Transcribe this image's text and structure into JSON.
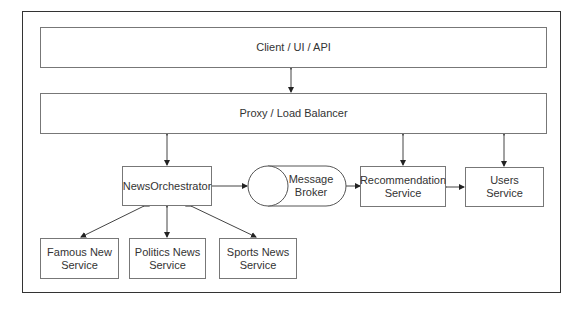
{
  "diagram": {
    "nodes": {
      "client": {
        "label": "Client / UI / API"
      },
      "proxy": {
        "label": "Proxy / Load Balancer"
      },
      "orchestrator": {
        "label": "NewsOrchestrator"
      },
      "broker": {
        "label_line1": "Message",
        "label_line2": "Broker",
        "shape": "cylinder"
      },
      "recommendation": {
        "label_line1": "Recommendation",
        "label_line2": "Service"
      },
      "users": {
        "label_line1": "Users",
        "label_line2": "Service"
      },
      "famous": {
        "label_line1": "Famous New",
        "label_line2": "Service"
      },
      "politics": {
        "label_line1": "Politics News",
        "label_line2": "Service"
      },
      "sports": {
        "label_line1": "Sports News",
        "label_line2": "Service"
      }
    },
    "edges": [
      {
        "from": "client",
        "to": "proxy",
        "bidirectional": true
      },
      {
        "from": "proxy",
        "to": "orchestrator",
        "bidirectional": true
      },
      {
        "from": "proxy",
        "to": "recommendation",
        "bidirectional": true
      },
      {
        "from": "proxy",
        "to": "users",
        "bidirectional": true
      },
      {
        "from": "orchestrator",
        "to": "broker",
        "bidirectional": false
      },
      {
        "from": "broker",
        "to": "recommendation",
        "bidirectional": false
      },
      {
        "from": "recommendation",
        "to": "users",
        "bidirectional": true
      },
      {
        "from": "orchestrator",
        "to": "famous",
        "bidirectional": true
      },
      {
        "from": "orchestrator",
        "to": "politics",
        "bidirectional": true
      },
      {
        "from": "orchestrator",
        "to": "sports",
        "bidirectional": true
      }
    ]
  }
}
